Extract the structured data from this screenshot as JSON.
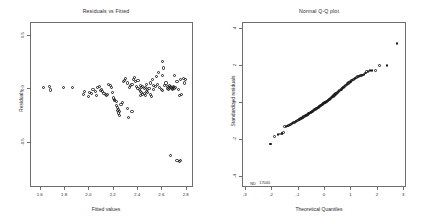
{
  "figure": {
    "background": "#ffffff",
    "frame_color": "#6e6e6e",
    "marker_color": "#1c1c1c",
    "text_color": "#2b2b2b"
  },
  "chart_data": [
    {
      "type": "scatter",
      "panel": "left",
      "title": "Residuals vs Fitted",
      "xlabel": "Fitted values",
      "ylabel": "Residuals",
      "xlim": [
        1.52,
        2.86
      ],
      "ylim": [
        -0.92,
        0.62
      ],
      "xticks": [
        1.6,
        1.8,
        2.0,
        2.2,
        2.4,
        2.6,
        2.8
      ],
      "xticklabels": [
        "1.6",
        "1.8",
        "2.0",
        "2.2",
        "2.4",
        "2.6",
        "2.8"
      ],
      "yticks": [
        0.5,
        0.0,
        -0.5
      ],
      "yticklabels": [
        "0.5",
        "0.0",
        "-0.5"
      ],
      "grid": false,
      "legend": false,
      "marker": "open-circle",
      "x": [
        1.62,
        1.67,
        1.68,
        1.79,
        1.86,
        1.95,
        1.96,
        1.99,
        2.0,
        2.02,
        2.03,
        2.05,
        2.06,
        2.07,
        2.08,
        2.09,
        2.1,
        2.11,
        2.12,
        2.13,
        2.14,
        2.15,
        2.16,
        2.17,
        2.18,
        2.19,
        2.2,
        2.21,
        2.21,
        2.22,
        2.22,
        2.23,
        2.23,
        2.24,
        2.24,
        2.25,
        2.25,
        2.26,
        2.27,
        2.28,
        2.29,
        2.3,
        2.31,
        2.31,
        2.32,
        2.33,
        2.34,
        2.35,
        2.35,
        2.36,
        2.37,
        2.38,
        2.39,
        2.4,
        2.4,
        2.41,
        2.42,
        2.42,
        2.43,
        2.43,
        2.44,
        2.44,
        2.45,
        2.45,
        2.46,
        2.46,
        2.47,
        2.47,
        2.48,
        2.48,
        2.49,
        2.5,
        2.5,
        2.51,
        2.52,
        2.53,
        2.54,
        2.55,
        2.56,
        2.57,
        2.58,
        2.59,
        2.6,
        2.6,
        2.61,
        2.62,
        2.63,
        2.64,
        2.64,
        2.65,
        2.65,
        2.66,
        2.66,
        2.67,
        2.67,
        2.68,
        2.68,
        2.69,
        2.69,
        2.7,
        2.7,
        2.71,
        2.72,
        2.73,
        2.74,
        2.75,
        2.76,
        2.77,
        2.78,
        2.79,
        2.6,
        2.72,
        2.74,
        2.75,
        2.67,
        2.53,
        2.42
      ],
      "y": [
        0.02,
        0.03,
        -0.005,
        0.02,
        0.02,
        -0.05,
        -0.02,
        -0.07,
        -0.03,
        -0.04,
        0.0,
        -0.02,
        -0.06,
        0.02,
        0.03,
        -0.01,
        0.0,
        -0.02,
        -0.04,
        -0.05,
        -0.06,
        -0.05,
        0.05,
        0.04,
        0.02,
        -0.03,
        -0.08,
        -0.09,
        -0.1,
        -0.11,
        -0.15,
        -0.17,
        -0.2,
        -0.19,
        -0.22,
        -0.24,
        -0.21,
        -0.14,
        -0.12,
        0.07,
        0.08,
        0.1,
        0.06,
        -0.18,
        -0.26,
        0.02,
        0.04,
        0.05,
        -0.21,
        0.09,
        0.11,
        0.07,
        0.03,
        0.08,
        0.01,
        0.0,
        -0.02,
        0.04,
        -0.03,
        0.02,
        -0.05,
        0.03,
        -0.04,
        0.01,
        -0.06,
        0.02,
        -0.02,
        0.05,
        -0.03,
        0.0,
        0.01,
        -0.05,
        0.06,
        -0.07,
        0.09,
        0.04,
        0.03,
        0.12,
        0.05,
        0.16,
        0.02,
        0.0,
        0.13,
        -0.01,
        0.2,
        0.04,
        0.06,
        0.01,
        0.03,
        0.0,
        0.02,
        0.01,
        0.04,
        0.03,
        0.02,
        0.01,
        0.0,
        0.02,
        0.03,
        0.01,
        0.13,
        0.02,
        0.07,
        0.0,
        -0.06,
        0.09,
        -0.05,
        0.1,
        0.06,
        0.09,
        0.26,
        -0.66,
        -0.67,
        -0.66,
        -0.62,
        0.0,
        -0.06
      ]
    },
    {
      "type": "scatter",
      "panel": "right",
      "title": "Normal Q-Q plot",
      "xlabel": "Theoretical Quantiles",
      "ylabel": "Standardized residuals",
      "xlim": [
        -3.1,
        3.1
      ],
      "ylim": [
        -4.6,
        4.3
      ],
      "xticks": [
        -3,
        -2,
        -1,
        0,
        1,
        2,
        3
      ],
      "xticklabels": [
        "-3",
        "-2",
        "-1",
        "0",
        "1",
        "2",
        "3"
      ],
      "yticks": [
        4,
        2,
        0,
        -2,
        -4
      ],
      "yticklabels": [
        "4",
        "2",
        "0",
        "-2",
        "-4"
      ],
      "grid": false,
      "legend": false,
      "marker": "open-circle",
      "annotations": [
        {
          "text": "ND",
          "x": -2.72,
          "y": -4.35
        },
        {
          "text": "17040",
          "x": -2.28,
          "y": -4.3
        }
      ],
      "x": [
        -2.05,
        -1.92,
        -1.78,
        -1.7,
        -1.63,
        -1.57,
        -1.52,
        -1.47,
        -1.42,
        -1.38,
        -1.34,
        -1.3,
        -1.26,
        -1.23,
        -1.19,
        -1.16,
        -1.13,
        -1.1,
        -1.07,
        -1.04,
        -1.01,
        -0.98,
        -0.96,
        -0.93,
        -0.9,
        -0.88,
        -0.85,
        -0.83,
        -0.8,
        -0.78,
        -0.76,
        -0.73,
        -0.71,
        -0.69,
        -0.66,
        -0.64,
        -0.62,
        -0.6,
        -0.58,
        -0.56,
        -0.53,
        -0.51,
        -0.49,
        -0.47,
        -0.45,
        -0.43,
        -0.41,
        -0.39,
        -0.37,
        -0.35,
        -0.33,
        -0.31,
        -0.29,
        -0.27,
        -0.25,
        -0.23,
        -0.21,
        -0.19,
        -0.17,
        -0.15,
        -0.13,
        -0.11,
        -0.09,
        -0.07,
        -0.05,
        -0.03,
        -0.01,
        0.01,
        0.03,
        0.05,
        0.07,
        0.09,
        0.11,
        0.13,
        0.15,
        0.17,
        0.19,
        0.21,
        0.23,
        0.25,
        0.27,
        0.29,
        0.31,
        0.33,
        0.35,
        0.37,
        0.39,
        0.41,
        0.43,
        0.45,
        0.47,
        0.49,
        0.51,
        0.53,
        0.56,
        0.58,
        0.6,
        0.62,
        0.64,
        0.66,
        0.69,
        0.71,
        0.73,
        0.76,
        0.78,
        0.8,
        0.83,
        0.85,
        0.88,
        0.9,
        0.93,
        0.96,
        0.98,
        1.01,
        1.04,
        1.07,
        1.1,
        1.13,
        1.16,
        1.19,
        1.23,
        1.26,
        1.3,
        1.34,
        1.38,
        1.42,
        1.47,
        1.52,
        1.57,
        1.63,
        1.7,
        1.78,
        1.92,
        2.05,
        2.35,
        2.72,
        -2.05,
        -1.62
      ],
      "y": [
        -2.22,
        -1.82,
        -1.72,
        -1.68,
        -1.66,
        -1.62,
        -1.3,
        -1.27,
        -1.25,
        -1.22,
        -1.2,
        -1.17,
        -1.14,
        -1.1,
        -1.08,
        -1.06,
        -1.04,
        -1.0,
        -0.98,
        -0.96,
        -0.94,
        -0.92,
        -0.9,
        -0.87,
        -0.85,
        -0.83,
        -0.8,
        -0.78,
        -0.76,
        -0.74,
        -0.72,
        -0.7,
        -0.68,
        -0.66,
        -0.64,
        -0.62,
        -0.6,
        -0.58,
        -0.56,
        -0.54,
        -0.52,
        -0.5,
        -0.48,
        -0.46,
        -0.44,
        -0.42,
        -0.4,
        -0.38,
        -0.36,
        -0.34,
        -0.32,
        -0.3,
        -0.28,
        -0.26,
        -0.24,
        -0.22,
        -0.2,
        -0.18,
        -0.16,
        -0.14,
        -0.12,
        -0.1,
        -0.08,
        -0.06,
        -0.04,
        -0.02,
        0.0,
        0.02,
        0.04,
        0.06,
        0.08,
        0.1,
        0.12,
        0.14,
        0.16,
        0.18,
        0.2,
        0.22,
        0.25,
        0.28,
        0.3,
        0.32,
        0.35,
        0.38,
        0.4,
        0.43,
        0.46,
        0.48,
        0.5,
        0.53,
        0.56,
        0.58,
        0.6,
        0.63,
        0.66,
        0.68,
        0.7,
        0.73,
        0.76,
        0.79,
        0.82,
        0.85,
        0.88,
        0.9,
        0.93,
        0.96,
        0.99,
        1.02,
        1.05,
        1.08,
        1.1,
        1.13,
        1.16,
        1.19,
        1.22,
        1.25,
        1.28,
        1.3,
        1.33,
        1.36,
        1.4,
        1.43,
        1.44,
        1.46,
        1.48,
        1.5,
        1.52,
        1.6,
        1.68,
        1.7,
        1.72,
        1.73,
        1.74,
        2.0,
        2.02,
        3.18,
        -2.22,
        -1.66
      ]
    }
  ]
}
